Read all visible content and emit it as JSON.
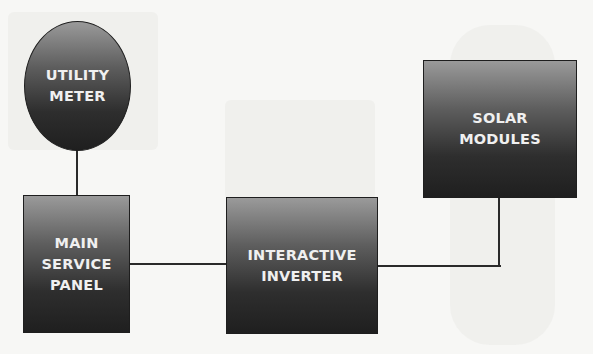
{
  "diagram": {
    "title": "",
    "nodes": [
      {
        "id": "utility_meter",
        "label": "UTILITY\nMETER",
        "shape": "ellipse"
      },
      {
        "id": "main_service_panel",
        "label": "MAIN\nSERVICE\nPANEL",
        "shape": "rect"
      },
      {
        "id": "interactive_inverter",
        "label": "INTERACTIVE\nINVERTER",
        "shape": "rect"
      },
      {
        "id": "solar_modules",
        "label": "SOLAR\nMODULES",
        "shape": "rect"
      }
    ],
    "edges": [
      {
        "from": "utility_meter",
        "to": "main_service_panel"
      },
      {
        "from": "main_service_panel",
        "to": "interactive_inverter"
      },
      {
        "from": "interactive_inverter",
        "to": "solar_modules"
      }
    ],
    "colors": {
      "node_fill_top": "#9a9a9a",
      "node_fill_bottom": "#1f1f1f",
      "node_text": "#f0f0f0",
      "line": "#2a2a2a",
      "background": "#f7f7f5"
    }
  }
}
